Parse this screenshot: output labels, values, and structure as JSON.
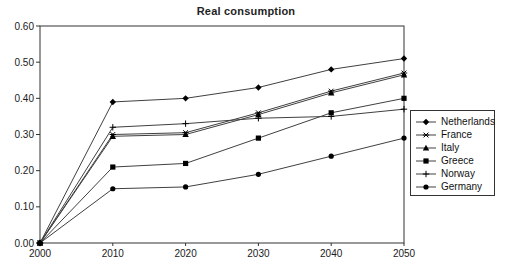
{
  "chart_data": {
    "type": "line",
    "title": "Real consumption",
    "x": [
      2000,
      2010,
      2020,
      2030,
      2040,
      2050
    ],
    "xlabel": "",
    "ylabel": "",
    "ylim": [
      0,
      0.6
    ],
    "ytick_step": 0.1,
    "y_tick_labels": [
      "0.00",
      "0.10",
      "0.20",
      "0.30",
      "0.40",
      "0.50",
      "0.60"
    ],
    "x_tick_labels": [
      "2000",
      "2010",
      "2020",
      "2030",
      "2040",
      "2050"
    ],
    "grid": false,
    "legend_position": "right",
    "series": [
      {
        "name": "Netherlands",
        "marker": "diamond",
        "values": [
          0.0,
          0.39,
          0.4,
          0.43,
          0.48,
          0.51
        ]
      },
      {
        "name": "France",
        "marker": "asterisk",
        "values": [
          0.0,
          0.3,
          0.305,
          0.36,
          0.42,
          0.47
        ]
      },
      {
        "name": "Italy",
        "marker": "triangle",
        "values": [
          0.0,
          0.295,
          0.3,
          0.355,
          0.415,
          0.465
        ]
      },
      {
        "name": "Greece",
        "marker": "square",
        "values": [
          0.0,
          0.21,
          0.22,
          0.29,
          0.36,
          0.4
        ]
      },
      {
        "name": "Norway",
        "marker": "plus",
        "values": [
          0.0,
          0.32,
          0.33,
          0.345,
          0.35,
          0.37
        ]
      },
      {
        "name": "Germany",
        "marker": "circle",
        "values": [
          0.0,
          0.15,
          0.155,
          0.19,
          0.24,
          0.29
        ]
      }
    ],
    "colors": {
      "line": "#404040",
      "marker": "#000000",
      "axis": "#333333",
      "text": "#1a1a1a"
    }
  }
}
